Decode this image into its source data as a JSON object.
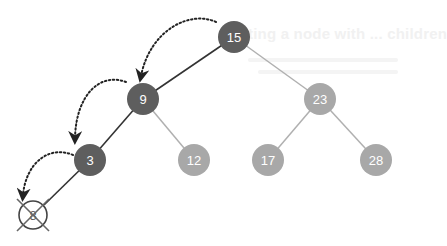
{
  "diagram": {
    "type": "binary-search-tree",
    "background_text": "ting a node with ... children",
    "colors": {
      "search_path_node": "#5e5e5e",
      "other_node": "#a8a8a8",
      "search_path_edge": "#333333",
      "other_edge": "#b0b0b0",
      "arrow": "#222222",
      "deleted_node_stroke": "#444444"
    },
    "nodes": [
      {
        "id": "n15",
        "label": "15",
        "x": 234,
        "y": 37,
        "on_path": true
      },
      {
        "id": "n9",
        "label": "9",
        "x": 143,
        "y": 99,
        "on_path": true
      },
      {
        "id": "n23",
        "label": "23",
        "x": 320,
        "y": 99,
        "on_path": false
      },
      {
        "id": "n3",
        "label": "3",
        "x": 90,
        "y": 160,
        "on_path": true
      },
      {
        "id": "n12",
        "label": "12",
        "x": 194,
        "y": 160,
        "on_path": false
      },
      {
        "id": "n17",
        "label": "17",
        "x": 268,
        "y": 160,
        "on_path": false
      },
      {
        "id": "n28",
        "label": "28",
        "x": 376,
        "y": 160,
        "on_path": false
      }
    ],
    "deleted_node": {
      "label": "8",
      "x": 33,
      "y": 215,
      "marker": "crossed-out"
    },
    "edges": [
      {
        "from": "15",
        "to": "9",
        "on_path": true
      },
      {
        "from": "15",
        "to": "23",
        "on_path": false
      },
      {
        "from": "9",
        "to": "3",
        "on_path": true
      },
      {
        "from": "9",
        "to": "12",
        "on_path": false
      },
      {
        "from": "23",
        "to": "17",
        "on_path": false
      },
      {
        "from": "23",
        "to": "28",
        "on_path": false
      },
      {
        "from": "3",
        "to": "8",
        "on_path": true
      }
    ],
    "traversal_arrows": [
      {
        "from": "15",
        "to": "9"
      },
      {
        "from": "9",
        "to": "3"
      },
      {
        "from": "3",
        "to": "8"
      }
    ]
  }
}
